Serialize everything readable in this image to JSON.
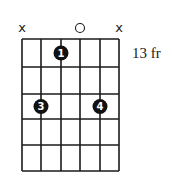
{
  "diagram": {
    "type": "guitar-chord-chart",
    "strings": 6,
    "frets_shown": 5,
    "position_label": "13 fr",
    "string_x": [
      22,
      41,
      61,
      80,
      100,
      119
    ],
    "fret_y": [
      39,
      67,
      94,
      119,
      145,
      171
    ],
    "open_muted": [
      {
        "string": 1,
        "symbol": "x",
        "state": "muted"
      },
      {
        "string": 4,
        "symbol": "o",
        "state": "open"
      },
      {
        "string": 6,
        "symbol": "x",
        "state": "muted"
      }
    ],
    "fingers": [
      {
        "string": 3,
        "fret": 1,
        "finger": "1"
      },
      {
        "string": 2,
        "fret": 3,
        "finger": "3"
      },
      {
        "string": 5,
        "fret": 3,
        "finger": "4"
      }
    ],
    "colors": {
      "line": "#1a1a1a",
      "dot": "#111111",
      "dot_text": "#ffffff",
      "background": "#ffffff"
    }
  }
}
